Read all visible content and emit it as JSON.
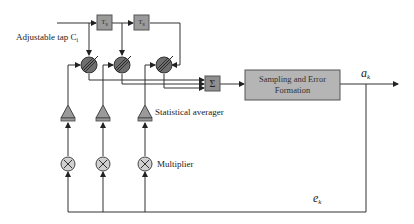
{
  "diagram": {
    "type": "adaptive-transversal-equalizer-block-diagram",
    "colors": {
      "line": "#333333",
      "block_fill": "#9a9a9a",
      "block_border": "#555555",
      "big_block_fill": "#b5b5b5",
      "circle_fill": "#d0d0d0"
    },
    "labels": {
      "adjustable_tap": "Adjustable tap C",
      "adjustable_tap_sub": "i",
      "statistical_averager": "Statistical averager",
      "multiplier": "Multiplier",
      "output": "a",
      "output_sub": "k",
      "error": "e",
      "error_sub": "k"
    },
    "blocks": {
      "delay_1": "T",
      "delay_1_sub": "s",
      "delay_2": "T",
      "delay_2_sub": "s",
      "summer": "Σ",
      "sampling_line1": "Sampling and Error",
      "sampling_line2": "Formation"
    },
    "taps": 3
  }
}
